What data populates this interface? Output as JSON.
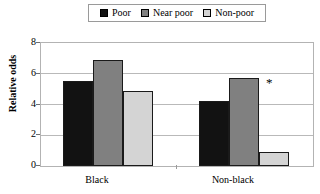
{
  "chart_data": {
    "type": "bar",
    "title": "",
    "xlabel": "",
    "ylabel": "Relative odds",
    "categories": [
      "Black",
      "Non-black"
    ],
    "series": [
      {
        "name": "Poor",
        "color": "#121212",
        "values": [
          5.5,
          4.2
        ]
      },
      {
        "name": "Near poor",
        "color": "#808080",
        "values": [
          6.9,
          5.75
        ]
      },
      {
        "name": "Non-poor",
        "color": "#d4d4d4",
        "values": [
          4.9,
          0.9
        ]
      }
    ],
    "ylim": [
      0,
      8
    ],
    "yticks": [
      0,
      2,
      4,
      6,
      8
    ],
    "ytick_labels": [
      "0",
      "2",
      "4",
      "6",
      "8"
    ],
    "grid": true,
    "grid_axis": "y",
    "legend_position": "top-center",
    "annotations": [
      {
        "text": "*",
        "marks": "Non-black / Non-poor",
        "category": "Non-black",
        "series": "Non-poor"
      }
    ]
  },
  "legend": {
    "entries": [
      {
        "label": "Poor"
      },
      {
        "label": "Near poor"
      },
      {
        "label": "Non-poor"
      }
    ]
  },
  "axes": {
    "y_label": "Relative odds",
    "y_ticks": [
      "8",
      "6",
      "4",
      "2",
      "0"
    ],
    "x_labels": [
      "Black",
      "Non-black"
    ]
  },
  "annotation": {
    "star": "*"
  }
}
